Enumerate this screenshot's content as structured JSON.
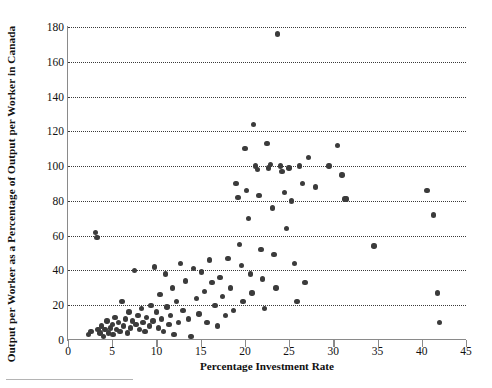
{
  "chart_data": {
    "type": "scatter",
    "title": "",
    "xlabel": "Percentage Investment Rate",
    "ylabel": "Output per Worker as a Percentage of Output per Worker in Canada",
    "xlim": [
      0,
      45
    ],
    "ylim": [
      0,
      180
    ],
    "xticks": [
      0,
      5,
      10,
      15,
      20,
      25,
      30,
      35,
      40,
      45
    ],
    "yticks": [
      0,
      20,
      40,
      60,
      80,
      100,
      120,
      140,
      160,
      180
    ],
    "grid": "horizontal-dotted",
    "legend": "none",
    "marker": {
      "shape": "circle",
      "color": "#3b3b3b",
      "size": 5.4
    },
    "points": [
      {
        "x": 2.3,
        "y": 3
      },
      {
        "x": 2.6,
        "y": 5
      },
      {
        "x": 3.1,
        "y": 62
      },
      {
        "x": 3.3,
        "y": 59
      },
      {
        "x": 3.4,
        "y": 6
      },
      {
        "x": 3.6,
        "y": 4
      },
      {
        "x": 3.8,
        "y": 8
      },
      {
        "x": 4.0,
        "y": 2
      },
      {
        "x": 4.2,
        "y": 6
      },
      {
        "x": 4.4,
        "y": 11
      },
      {
        "x": 4.6,
        "y": 4
      },
      {
        "x": 4.8,
        "y": 7
      },
      {
        "x": 5.0,
        "y": 9
      },
      {
        "x": 5.1,
        "y": 3
      },
      {
        "x": 5.3,
        "y": 13
      },
      {
        "x": 5.5,
        "y": 6
      },
      {
        "x": 5.7,
        "y": 10
      },
      {
        "x": 5.9,
        "y": 5
      },
      {
        "x": 6.1,
        "y": 22
      },
      {
        "x": 6.3,
        "y": 8
      },
      {
        "x": 6.5,
        "y": 12
      },
      {
        "x": 6.7,
        "y": 4
      },
      {
        "x": 6.9,
        "y": 16
      },
      {
        "x": 7.1,
        "y": 7
      },
      {
        "x": 7.3,
        "y": 11
      },
      {
        "x": 7.5,
        "y": 40
      },
      {
        "x": 7.7,
        "y": 9
      },
      {
        "x": 7.9,
        "y": 14
      },
      {
        "x": 8.1,
        "y": 6
      },
      {
        "x": 8.3,
        "y": 18
      },
      {
        "x": 8.5,
        "y": 10
      },
      {
        "x": 8.7,
        "y": 5
      },
      {
        "x": 8.9,
        "y": 13
      },
      {
        "x": 9.2,
        "y": 8
      },
      {
        "x": 9.4,
        "y": 20
      },
      {
        "x": 9.6,
        "y": 11
      },
      {
        "x": 9.8,
        "y": 42
      },
      {
        "x": 10.0,
        "y": 16
      },
      {
        "x": 10.2,
        "y": 7
      },
      {
        "x": 10.4,
        "y": 26
      },
      {
        "x": 10.6,
        "y": 12
      },
      {
        "x": 10.8,
        "y": 5
      },
      {
        "x": 11.0,
        "y": 38
      },
      {
        "x": 11.2,
        "y": 19
      },
      {
        "x": 11.4,
        "y": 9
      },
      {
        "x": 11.6,
        "y": 14
      },
      {
        "x": 11.8,
        "y": 30
      },
      {
        "x": 12.0,
        "y": 3
      },
      {
        "x": 12.3,
        "y": 22
      },
      {
        "x": 12.5,
        "y": 10
      },
      {
        "x": 12.7,
        "y": 44
      },
      {
        "x": 13.0,
        "y": 17
      },
      {
        "x": 13.3,
        "y": 34
      },
      {
        "x": 13.6,
        "y": 12
      },
      {
        "x": 13.9,
        "y": 2
      },
      {
        "x": 14.2,
        "y": 41
      },
      {
        "x": 14.5,
        "y": 24
      },
      {
        "x": 14.8,
        "y": 15
      },
      {
        "x": 15.1,
        "y": 39
      },
      {
        "x": 15.4,
        "y": 28
      },
      {
        "x": 15.7,
        "y": 10
      },
      {
        "x": 16.0,
        "y": 46
      },
      {
        "x": 16.3,
        "y": 33
      },
      {
        "x": 16.6,
        "y": 20
      },
      {
        "x": 16.9,
        "y": 8
      },
      {
        "x": 17.2,
        "y": 36
      },
      {
        "x": 17.5,
        "y": 25
      },
      {
        "x": 17.8,
        "y": 14
      },
      {
        "x": 18.1,
        "y": 47
      },
      {
        "x": 18.4,
        "y": 30
      },
      {
        "x": 18.7,
        "y": 17
      },
      {
        "x": 19.0,
        "y": 90
      },
      {
        "x": 19.2,
        "y": 82
      },
      {
        "x": 19.4,
        "y": 55
      },
      {
        "x": 19.6,
        "y": 43
      },
      {
        "x": 19.8,
        "y": 22
      },
      {
        "x": 20.0,
        "y": 110
      },
      {
        "x": 20.2,
        "y": 86
      },
      {
        "x": 20.4,
        "y": 70
      },
      {
        "x": 20.6,
        "y": 38
      },
      {
        "x": 20.8,
        "y": 27
      },
      {
        "x": 21.0,
        "y": 124
      },
      {
        "x": 21.2,
        "y": 100
      },
      {
        "x": 21.4,
        "y": 98
      },
      {
        "x": 21.6,
        "y": 83
      },
      {
        "x": 21.8,
        "y": 52
      },
      {
        "x": 22.0,
        "y": 35
      },
      {
        "x": 22.2,
        "y": 18
      },
      {
        "x": 22.5,
        "y": 113
      },
      {
        "x": 22.7,
        "y": 99
      },
      {
        "x": 22.9,
        "y": 101
      },
      {
        "x": 23.1,
        "y": 76
      },
      {
        "x": 23.3,
        "y": 49
      },
      {
        "x": 23.5,
        "y": 30
      },
      {
        "x": 23.7,
        "y": 176
      },
      {
        "x": 24.0,
        "y": 100
      },
      {
        "x": 24.2,
        "y": 97
      },
      {
        "x": 24.5,
        "y": 85
      },
      {
        "x": 24.7,
        "y": 64
      },
      {
        "x": 25.0,
        "y": 99
      },
      {
        "x": 25.3,
        "y": 80
      },
      {
        "x": 25.6,
        "y": 44
      },
      {
        "x": 25.9,
        "y": 22
      },
      {
        "x": 26.2,
        "y": 100
      },
      {
        "x": 26.5,
        "y": 90
      },
      {
        "x": 26.8,
        "y": 33
      },
      {
        "x": 27.2,
        "y": 105
      },
      {
        "x": 28.0,
        "y": 88
      },
      {
        "x": 29.5,
        "y": 100
      },
      {
        "x": 30.5,
        "y": 112
      },
      {
        "x": 31.0,
        "y": 95
      },
      {
        "x": 31.3,
        "y": 81
      },
      {
        "x": 31.5,
        "y": 81
      },
      {
        "x": 34.6,
        "y": 54
      },
      {
        "x": 40.6,
        "y": 86
      },
      {
        "x": 41.3,
        "y": 72
      },
      {
        "x": 41.8,
        "y": 27
      },
      {
        "x": 42.0,
        "y": 10
      }
    ]
  }
}
